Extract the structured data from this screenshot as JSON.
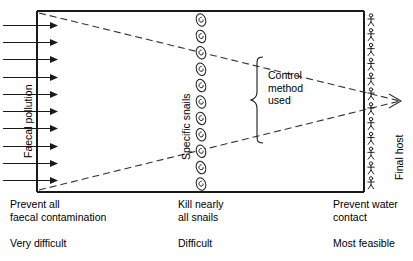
{
  "diagram": {
    "stage_labels": {
      "left": "Faecal pollution",
      "middle": "Specific snails",
      "right": "Final host"
    },
    "control_brace_label": "Control\nmethod\nused",
    "control_brace_lines": [
      "Control",
      "method",
      "used"
    ],
    "bottom_methods": [
      {
        "lines": [
          "Prevent all",
          "faecal contamination"
        ],
        "feasibility": "Very difficult"
      },
      {
        "lines": [
          "Kill nearly",
          "all snails"
        ],
        "feasibility": "Difficult"
      },
      {
        "lines": [
          "Prevent water",
          "contact"
        ],
        "feasibility": "Most feasible"
      }
    ],
    "icons": {
      "left_column": {
        "name": "arrow-right-icon",
        "count": 10
      },
      "middle_column": {
        "name": "snail-shell-icon",
        "count": 11
      },
      "right_column": {
        "name": "stick-figure-person-icon",
        "count": 12
      }
    },
    "funnel": {
      "style": "dashed",
      "description": "Two dashed lines converging from the left frame edge to an arrowhead at the right",
      "apex_marker": "arrowhead-right-icon"
    },
    "colors": {
      "line": "#1a1a1a",
      "dashed": "#333333",
      "text": "#000000",
      "background": "#ffffff"
    }
  }
}
